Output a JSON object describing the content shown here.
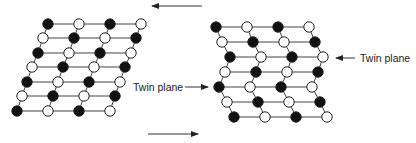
{
  "figure": {
    "labels": {
      "twin_plane_right": "Twin plane",
      "twin_plane_left": "Twin plane"
    },
    "arrows": {
      "top_shear": {
        "x1": 202,
        "y1": 6,
        "x2": 152,
        "y2": 6,
        "direction": "left"
      },
      "bottom_shear": {
        "x1": 148,
        "y1": 134,
        "x2": 198,
        "y2": 134,
        "direction": "right"
      },
      "twin_right_pointer": {
        "x1": 355,
        "y1": 58,
        "x2": 336,
        "y2": 58,
        "direction": "left"
      },
      "twin_left_pointer": {
        "x1": 185,
        "y1": 87,
        "x2": 208,
        "y2": 87,
        "direction": "right"
      }
    },
    "colors": {
      "filled_atom": "#111111",
      "open_atom": "#ffffff",
      "bond": "#444444"
    },
    "lattices": [
      {
        "name": "original-lattice",
        "rows": [
          {
            "y": 24,
            "x0": 48,
            "start": "B"
          },
          {
            "y": 38,
            "x0": 43,
            "start": "W"
          },
          {
            "y": 53,
            "x0": 38,
            "start": "B"
          },
          {
            "y": 67,
            "x0": 32,
            "start": "W"
          },
          {
            "y": 82,
            "x0": 27,
            "start": "B"
          },
          {
            "y": 96,
            "x0": 22,
            "start": "W"
          },
          {
            "y": 111,
            "x0": 17,
            "start": "B"
          }
        ],
        "spacing": 31,
        "atoms_per_row": 4
      },
      {
        "name": "twinned-lattice",
        "rows": [
          {
            "y": 27,
            "x0": 216,
            "start": "B"
          },
          {
            "y": 42,
            "x0": 222,
            "start": "W"
          },
          {
            "y": 57,
            "x0": 230,
            "start": "B"
          },
          {
            "y": 72,
            "x0": 225,
            "start": "W"
          },
          {
            "y": 87,
            "x0": 219,
            "start": "B"
          },
          {
            "y": 102,
            "x0": 227,
            "start": "W"
          },
          {
            "y": 117,
            "x0": 234,
            "start": "B"
          }
        ],
        "spacing": 31,
        "atoms_per_row": 4
      }
    ]
  }
}
